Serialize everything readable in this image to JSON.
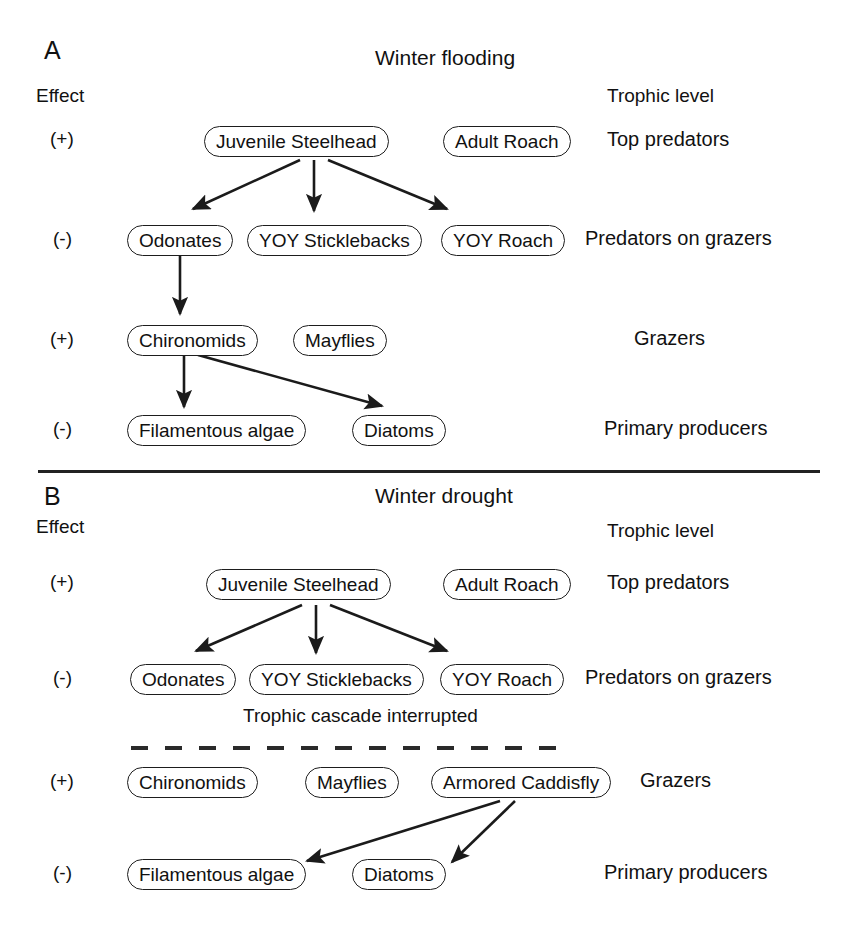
{
  "figure": {
    "width": 844,
    "height": 935,
    "background": "#ffffff",
    "ink_color": "#1b1b1b"
  },
  "column_headers": {
    "effect": "Effect",
    "trophic_level": "Trophic level"
  },
  "panels": [
    {
      "letter": "A",
      "title": "Winter flooding",
      "effect_header": "Effect",
      "trophic_header": "Trophic level",
      "rows": [
        {
          "effect": "(+)",
          "trophic_level": "Top predators",
          "nodes": [
            "Juvenile Steelhead",
            "Adult Roach"
          ]
        },
        {
          "effect": "(-)",
          "trophic_level": "Predators on grazers",
          "nodes": [
            "Odonates",
            "YOY Sticklebacks",
            "YOY Roach"
          ]
        },
        {
          "effect": "(+)",
          "trophic_level": "Grazers",
          "nodes": [
            "Chironomids",
            "Mayflies"
          ]
        },
        {
          "effect": "(-)",
          "trophic_level": "Primary producers",
          "nodes": [
            "Filamentous algae",
            "Diatoms"
          ]
        }
      ],
      "links": [
        {
          "from": "Juvenile Steelhead",
          "to": "Odonates"
        },
        {
          "from": "Juvenile Steelhead",
          "to": "YOY Sticklebacks"
        },
        {
          "from": "Juvenile Steelhead",
          "to": "YOY Roach"
        },
        {
          "from": "Odonates",
          "to": "Chironomids"
        },
        {
          "from": "Chironomids",
          "to": "Filamentous algae"
        },
        {
          "from": "Chironomids",
          "to": "Diatoms"
        }
      ],
      "annotations": []
    },
    {
      "letter": "B",
      "title": "Winter drought",
      "effect_header": "Effect",
      "trophic_header": "Trophic level",
      "rows": [
        {
          "effect": "(+)",
          "trophic_level": "Top predators",
          "nodes": [
            "Juvenile Steelhead",
            "Adult Roach"
          ]
        },
        {
          "effect": "(-)",
          "trophic_level": "Predators on grazers",
          "nodes": [
            "Odonates",
            "YOY Sticklebacks",
            "YOY Roach"
          ]
        },
        {
          "effect": "(+)",
          "trophic_level": "Grazers",
          "nodes": [
            "Chironomids",
            "Mayflies",
            "Armored Caddisfly"
          ]
        },
        {
          "effect": "(-)",
          "trophic_level": "Primary producers",
          "nodes": [
            "Filamentous algae",
            "Diatoms"
          ]
        }
      ],
      "links": [
        {
          "from": "Juvenile Steelhead",
          "to": "Odonates"
        },
        {
          "from": "Juvenile Steelhead",
          "to": "YOY Sticklebacks"
        },
        {
          "from": "Juvenile Steelhead",
          "to": "YOY Roach"
        },
        {
          "from": "Armored Caddisfly",
          "to": "Filamentous algae"
        },
        {
          "from": "Armored Caddisfly",
          "to": "Diatoms"
        }
      ],
      "annotations": [
        {
          "text": "Trophic cascade interrupted",
          "style": "dashed-barrier"
        }
      ]
    }
  ],
  "panel_a": {
    "letter": "A",
    "title": "Winter flooding",
    "effect_header": "Effect",
    "trophic_header": "Trophic level",
    "effects": {
      "r1": "(+)",
      "r2": "(-)",
      "r3": "(+)",
      "r4": "(-)"
    },
    "trophic": {
      "r1": "Top predators",
      "r2": "Predators on grazers",
      "r3": "Grazers",
      "r4": "Primary producers"
    },
    "nodes": {
      "juvenile_steelhead": "Juvenile Steelhead",
      "adult_roach": "Adult Roach",
      "odonates": "Odonates",
      "yoy_sticklebacks": "YOY Sticklebacks",
      "yoy_roach": "YOY Roach",
      "chironomids": "Chironomids",
      "mayflies": "Mayflies",
      "filamentous_algae": "Filamentous algae",
      "diatoms": "Diatoms"
    }
  },
  "panel_b": {
    "letter": "B",
    "title": "Winter drought",
    "effect_header": "Effect",
    "trophic_header": "Trophic level",
    "interrupt_note": "Trophic cascade interrupted",
    "effects": {
      "r1": "(+)",
      "r2": "(-)",
      "r3": "(+)",
      "r4": "(-)"
    },
    "trophic": {
      "r1": "Top predators",
      "r2": "Predators on grazers",
      "r3": "Grazers",
      "r4": "Primary producers"
    },
    "nodes": {
      "juvenile_steelhead": "Juvenile Steelhead",
      "adult_roach": "Adult Roach",
      "odonates": "Odonates",
      "yoy_sticklebacks": "YOY Sticklebacks",
      "yoy_roach": "YOY Roach",
      "chironomids": "Chironomids",
      "mayflies": "Mayflies",
      "armored_caddisfly": "Armored Caddisfly",
      "filamentous_algae": "Filamentous algae",
      "diatoms": "Diatoms"
    }
  }
}
